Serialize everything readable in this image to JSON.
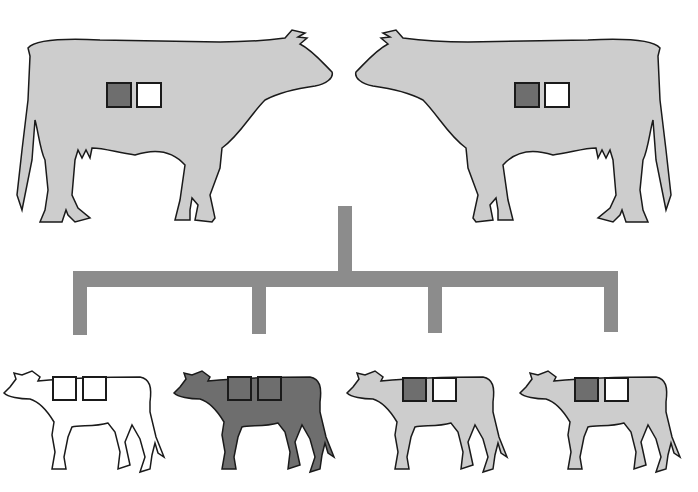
{
  "diagram": {
    "type": "genetic-inheritance-cross",
    "colors": {
      "background": "#ffffff",
      "light_gray_coat": "#cdcdcd",
      "dark_coat": "#6e6e6e",
      "white_coat": "#ffffff",
      "dark_allele": "#6e6e6e",
      "white_allele": "#ffffff",
      "outline": "#1a1a1a",
      "connector": "#8c8c8c"
    },
    "parents": [
      {
        "id": "parent-left",
        "facing": "right",
        "coat": "light-gray",
        "alleles": [
          "dark",
          "white"
        ]
      },
      {
        "id": "parent-right",
        "facing": "left",
        "coat": "light-gray",
        "alleles": [
          "dark",
          "white"
        ]
      }
    ],
    "offspring": [
      {
        "id": "calf-1",
        "coat": "white",
        "alleles": [
          "white",
          "white"
        ]
      },
      {
        "id": "calf-2",
        "coat": "dark",
        "alleles": [
          "dark",
          "dark"
        ]
      },
      {
        "id": "calf-3",
        "coat": "light-gray",
        "alleles": [
          "dark",
          "white"
        ]
      },
      {
        "id": "calf-4",
        "coat": "light-gray",
        "alleles": [
          "dark",
          "white"
        ]
      }
    ]
  }
}
